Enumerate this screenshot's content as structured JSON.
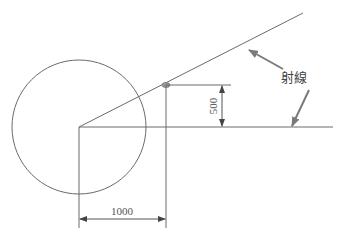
{
  "diagram": {
    "colors": {
      "line": "#6a6a6a",
      "leader": "#8a8a8a",
      "text": "#555555",
      "point": "#999999"
    },
    "circle": {
      "cx": 79,
      "cy": 127,
      "r": 67
    },
    "rays": [
      {
        "name": "upper-ray",
        "x1": 79,
        "y1": 127,
        "x2": 303,
        "y2": 13
      },
      {
        "name": "horizontal-ray",
        "x1": 79,
        "y1": 127,
        "x2": 333,
        "y2": 127
      }
    ],
    "intersection_point": {
      "x": 166,
      "y": 85
    },
    "dimensions": {
      "vertical": {
        "label": "500",
        "x": 222,
        "y_top": 85,
        "y_bottom": 127
      },
      "horizontal": {
        "label": "1000",
        "y": 219,
        "x_left": 79,
        "x_right": 166
      }
    },
    "callout": {
      "label": "射線",
      "x": 280,
      "y": 82
    }
  }
}
